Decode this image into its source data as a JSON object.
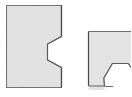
{
  "figure": {
    "type": "technical-shape-drawing",
    "background_color": "#ffffff",
    "canvas": {
      "width": 131,
      "height": 97
    },
    "fill_color": "#e3e3e3",
    "stroke_color": "#6e6e6e",
    "stroke_color_dark": "#4a4a4a",
    "stroke_width": 1.2,
    "shapes": [
      {
        "id": "left-plate",
        "label": "left plate with hexagonal notch",
        "rect": {
          "x": 6,
          "y": 5,
          "width": 56,
          "height": 83
        },
        "notch": {
          "type": "hexagon",
          "edge": "right",
          "center_x": 53,
          "center_y": 52,
          "radius": 17
        },
        "outline_points": "6,5 62,5 62,36 46,43 46,61 62,68 62,88 6,88"
      },
      {
        "id": "right-plate",
        "label": "right plate with hexagonal notch, cropped at image edge",
        "rect": {
          "x": 88,
          "y": 31,
          "width": 43,
          "height": 55
        },
        "notch": {
          "type": "hexagon",
          "edge": "bottom",
          "center_x": 122,
          "center_y": 83,
          "radius": 17
        },
        "outline_points": "88,31 131,31 131,86 110,86 102,75 110,64 131,64 131,86 88,86"
      }
    ]
  }
}
